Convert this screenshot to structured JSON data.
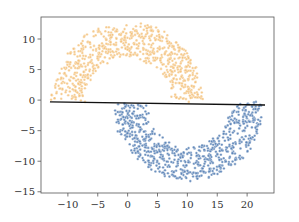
{
  "chart_data": {
    "type": "scatter",
    "title": "",
    "xlabel": "",
    "ylabel": "",
    "xlim": [
      -14.5,
      24.5
    ],
    "ylim": [
      -15.2,
      13.6
    ],
    "grid": false,
    "legend": null,
    "x_ticks": [
      -10,
      -5,
      0,
      5,
      10,
      15,
      20
    ],
    "x_tick_labels": [
      "−10",
      "−5",
      "0",
      "5",
      "10",
      "15",
      "20"
    ],
    "y_ticks": [
      -15,
      -10,
      -5,
      0,
      5,
      10
    ],
    "y_tick_labels": [
      "−15",
      "−10",
      "−5",
      "0",
      "5",
      "10"
    ],
    "series": [
      {
        "name": "class 0 (upper moon)",
        "color": "#f5c27a",
        "shape": "half-ring",
        "center": [
          0,
          0
        ],
        "inner_radius": 7.2,
        "outer_radius": 12.6,
        "angle_range_deg": [
          0,
          180
        ],
        "approx_points": 700
      },
      {
        "name": "class 1 (lower moon)",
        "color": "#5b84b8",
        "shape": "half-ring",
        "center": [
          10.2,
          -0.5
        ],
        "inner_radius": 7.2,
        "outer_radius": 12.6,
        "angle_range_deg": [
          180,
          360
        ],
        "approx_points": 700
      }
    ],
    "lines": [
      {
        "name": "decision boundary",
        "color": "#111111",
        "x": [
          -13,
          23
        ],
        "y": [
          -0.3,
          -0.8
        ]
      }
    ]
  }
}
